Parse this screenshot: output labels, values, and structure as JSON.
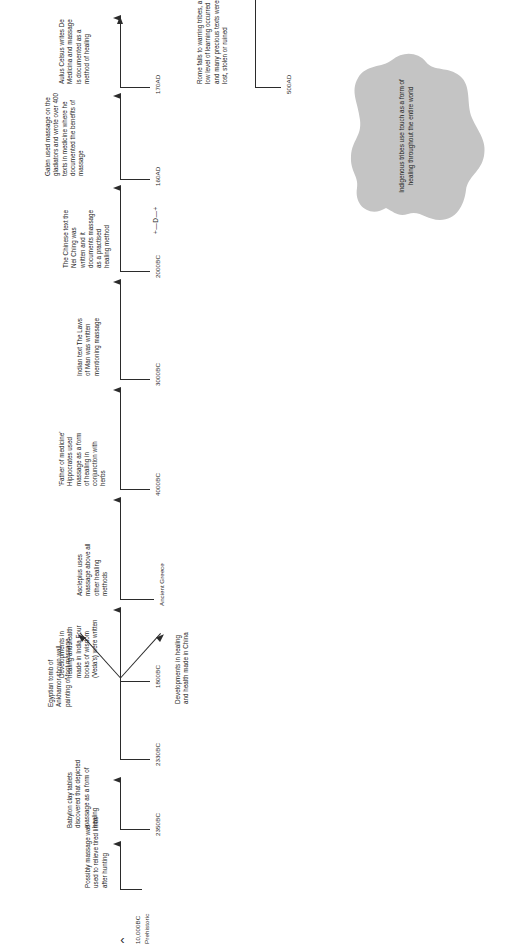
{
  "diagram": {
    "orientation": "rotated-90",
    "blob": {
      "text": "Indigenous tribes use touch as a form of healing throughout the entire world",
      "color": "#c4c4c4"
    },
    "start_marker": {
      "glyph": "‹",
      "date": "10,000BC",
      "era": "Prehistoric"
    },
    "mid_marker": {
      "glyph": "+—D—+"
    },
    "era_labels": [
      {
        "label": "Ancient Greece"
      }
    ],
    "events": [
      {
        "date": "10,000BC",
        "era": "Prehistoric",
        "text": "Possibly massage was used to relieve tired limbs after hunting"
      },
      {
        "date": "2350BC",
        "era": "",
        "text": "Babylon clay tablets discovered that depicted massage as a form of healing"
      },
      {
        "date": "2330BC",
        "era": "",
        "text": "Egyptian tomb of Ankhamor shown wall painting of foot massage"
      },
      {
        "date": "2330BC",
        "era": "",
        "text": "Developments in healing and health made in China"
      },
      {
        "date": "1800BC",
        "era": "",
        "text": "Developments in healing and health made in India Four books of wisdom (Veda's) were written"
      },
      {
        "date": "",
        "era": "Ancient Greece",
        "text": "Asclepius uses massage above all other healing methods"
      },
      {
        "date": "4000BC",
        "era": "",
        "text": "'Father of medicine' Hippocrates used massage as a form of healing in conjunction with herbs"
      },
      {
        "date": "3000BC",
        "era": "",
        "text": "Indian text The Laws of Man was written mentioning massage"
      },
      {
        "date": "2000BC",
        "era": "",
        "text": "The Chinese text the Nei Ching was written and it documents massage as a practised healing method"
      },
      {
        "date": "160AD",
        "era": "",
        "text": "Galen used massage on the gladiators and wrote over 400 texts in medicine where he documented the benefits of massage"
      },
      {
        "date": "170AD",
        "era": "",
        "text": "Aulus Celsus writes De Medicina and massage is documented as a method of healing"
      },
      {
        "date": "500AD",
        "era": "",
        "text": "Rome falls to warring tribes, a low level of learning occurred and many precious texts were lost, stolen or ruined"
      }
    ],
    "dates": {
      "d_10000bc": "10,000BC",
      "d_prehistoric": "Prehistoric",
      "d_2350bc": "2350BC",
      "d_2330bc": "2330BC",
      "d_1800bc": "1800BC",
      "d_ancient_greece": "Ancient Greece",
      "d_4000bc": "4000BC",
      "d_3000bc": "3000BC",
      "d_2000bc": "2000BC",
      "d_marker": "+—D—+",
      "d_160ad": "160AD",
      "d_170ad": "170AD",
      "d_500ad": "500AD"
    }
  }
}
